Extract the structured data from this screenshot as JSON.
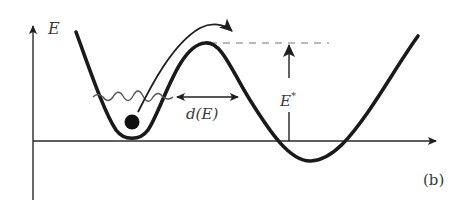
{
  "figure": {
    "panel_label": "(b)",
    "y_axis_label": "E",
    "distance_label": "d(E)",
    "barrier_label_base": "E",
    "barrier_label_sup": "*",
    "elements": {
      "potential_curve": "double-well potential energy curve",
      "particle": "particle in left well",
      "thermal_fluctuation": "wavy line indicating energy fluctuation",
      "transition_arrow": "curved arrow over barrier",
      "barrier_height_arrow": "vertical arrow E*",
      "barrier_width_arrow": "horizontal double arrow d(E)",
      "barrier_top_reference": "dashed line at barrier top"
    }
  },
  "colors": {
    "curve": "#1a1a1a",
    "axes": "#2a2a2a",
    "wave": "#555555",
    "dashed": "#777777",
    "text": "#3a3a3a"
  }
}
